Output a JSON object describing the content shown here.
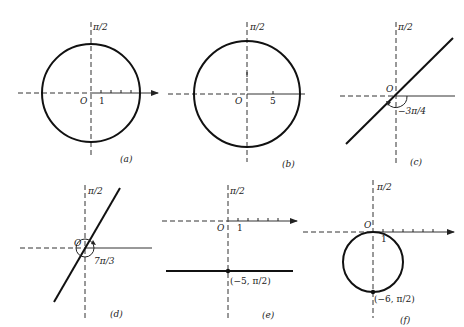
{
  "figure": {
    "panels": [
      {
        "id": "a",
        "caption": "(a)",
        "pole_label": "O",
        "polar_axis_label": "π/2",
        "tick_label": "1",
        "curve": "circle centered at pole",
        "radius_units": 5
      },
      {
        "id": "b",
        "caption": "(b)",
        "pole_label": "O",
        "polar_axis_label": "π/2",
        "tick_label": "5",
        "curve": "circle centered at pole"
      },
      {
        "id": "c",
        "caption": "(c)",
        "pole_label": "O",
        "polar_axis_label": "π/2",
        "angle_label": "−3π/4",
        "curve": "line through pole"
      },
      {
        "id": "d",
        "caption": "(d)",
        "pole_label": "O",
        "polar_axis_label": "π/2",
        "angle_label": "7π/3",
        "curve": "line through pole"
      },
      {
        "id": "e",
        "caption": "(e)",
        "pole_label": "O",
        "polar_axis_label": "π/2",
        "tick_label": "1",
        "point_label": "(−5, π/2)",
        "curve": "horizontal line"
      },
      {
        "id": "f",
        "caption": "(f)",
        "pole_label": "O",
        "polar_axis_label": "π/2",
        "tick_label": "1",
        "point_label": "(−6, π/2)",
        "curve": "circle tangent at pole"
      }
    ]
  }
}
